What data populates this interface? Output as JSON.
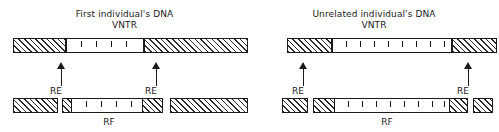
{
  "figure": {
    "type": "diagram",
    "panels": [
      {
        "id": "first-individual",
        "title_main": "First individual's DNA",
        "title_sub": "VNTR",
        "top_strand": {
          "segments": [
            {
              "kind": "flank",
              "fill": "hatched",
              "x": 13,
              "width": 53
            },
            {
              "kind": "repeat",
              "fill": "open",
              "x": 66,
              "width": 78,
              "ticks": 4
            },
            {
              "kind": "flank",
              "fill": "hatched",
              "x": 144,
              "width": 104
            }
          ]
        },
        "cut_sites": [
          {
            "label": "RE",
            "x": 61
          },
          {
            "label": "RE",
            "x": 156
          }
        ],
        "bottom_fragments": [
          {
            "kind": "flank",
            "fill": "hatched",
            "x": 13,
            "width": 45
          },
          {
            "kind": "flank",
            "fill": "hatched",
            "x": 62,
            "width": 9
          },
          {
            "kind": "repeat",
            "fill": "open",
            "x": 71,
            "width": 72,
            "ticks": 4
          },
          {
            "kind": "flank",
            "fill": "hatched",
            "x": 143,
            "width": 20
          },
          {
            "kind": "flank",
            "fill": "hatched",
            "x": 170,
            "width": 78
          }
        ],
        "fragment_label": "RF",
        "fragment_label_x": 107
      },
      {
        "id": "unrelated-individual",
        "title_main": "Unrelated individual's DNA",
        "title_sub": "VNTR",
        "top_strand": {
          "segments": [
            {
              "kind": "flank",
              "fill": "hatched",
              "x": 38,
              "width": 45
            },
            {
              "kind": "repeat",
              "fill": "open",
              "x": 83,
              "width": 120,
              "ticks": 8
            },
            {
              "kind": "flank",
              "fill": "hatched",
              "x": 203,
              "width": 45
            }
          ]
        },
        "cut_sites": [
          {
            "label": "RE",
            "x": 54
          },
          {
            "label": "RE",
            "x": 219
          }
        ],
        "bottom_fragments": [
          {
            "kind": "flank",
            "fill": "hatched",
            "x": 33,
            "width": 26
          },
          {
            "kind": "flank",
            "fill": "hatched",
            "x": 64,
            "width": 21
          },
          {
            "kind": "repeat",
            "fill": "open",
            "x": 85,
            "width": 116,
            "ticks": 8
          },
          {
            "kind": "flank",
            "fill": "hatched",
            "x": 201,
            "width": 18
          },
          {
            "kind": "flank",
            "fill": "hatched",
            "x": 224,
            "width": 20
          }
        ],
        "fragment_label": "RF",
        "fragment_label_x": 136
      }
    ],
    "colors": {
      "ink": "#1a1a1a",
      "hatch": "#2b2b2b",
      "background": "#ffffff"
    }
  }
}
